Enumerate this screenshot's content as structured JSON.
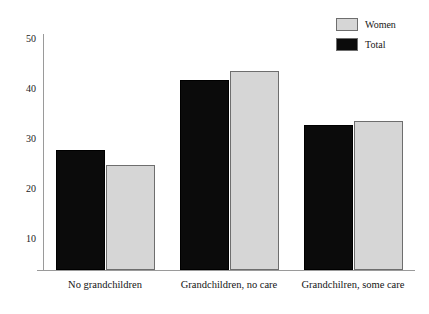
{
  "chart_data": {
    "type": "bar",
    "title": "",
    "subtitle": "",
    "xlabel": "",
    "ylabel": "",
    "categories": [
      "No grandchildren",
      "Grandchildren, no care",
      "Grandchilren, some care"
    ],
    "series": [
      {
        "name": "Total",
        "color": "#0b0b0b",
        "values": [
          27.6,
          41.6,
          32.6
        ]
      },
      {
        "name": "Women",
        "color": "#d6d6d6",
        "values": [
          24.6,
          43.5,
          33.5
        ]
      }
    ],
    "ylim": [
      3.6,
      50
    ],
    "yticks": [
      10,
      20,
      30,
      40,
      50
    ],
    "ytick_labels": [
      "10",
      "20",
      "30",
      "40",
      "50"
    ],
    "grid": false,
    "legend_position": "top-right",
    "legend_entries": [
      {
        "label": "Women",
        "swatch_color": "#d6d6d6"
      },
      {
        "label": "Total",
        "swatch_color": "#0b0b0b"
      }
    ]
  },
  "axis": {
    "line_color": "#9a9a9a"
  }
}
